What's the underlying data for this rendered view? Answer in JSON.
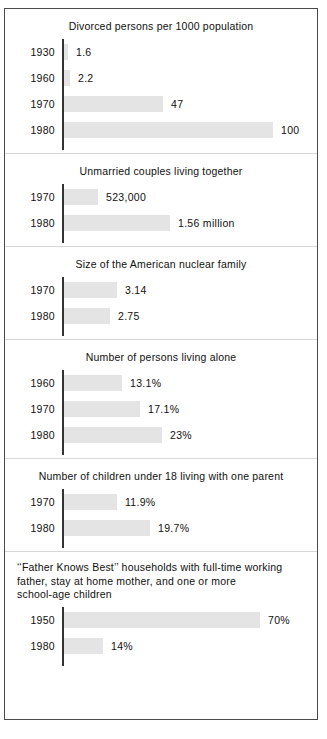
{
  "figure": {
    "border_color": "#4a4a4a",
    "bar_color": "#e4e4e4",
    "axis_color": "#333333",
    "divider_color": "#d8d8d8",
    "background": "#ffffff"
  },
  "chart_data": {
    "type": "bar",
    "title": "",
    "orientation": "horizontal",
    "grid": false,
    "legend": "none",
    "panels": [
      {
        "title": "Divorced persons per 1000 population",
        "title_lines": [
          "Divorced persons per 1000 population"
        ],
        "categories": [
          "1930",
          "1960",
          "1970",
          "1980"
        ],
        "values": [
          1.6,
          2.2,
          47,
          100
        ],
        "labels": [
          "1.6",
          "2.2",
          "47",
          "100"
        ],
        "bar_px": [
          4,
          6,
          99,
          209
        ],
        "xlabel": "",
        "ylabel": ""
      },
      {
        "title": "Unmarried couples living together",
        "title_lines": [
          "Unmarried couples living together"
        ],
        "categories": [
          "1970",
          "1980"
        ],
        "values": [
          523000,
          1560000
        ],
        "labels": [
          "523,000",
          "1.56 million"
        ],
        "bar_px": [
          34,
          106
        ],
        "xlabel": "",
        "ylabel": ""
      },
      {
        "title": "Size of the American nuclear family",
        "title_lines": [
          "Size of the American nuclear family"
        ],
        "categories": [
          "1970",
          "1980"
        ],
        "values": [
          3.14,
          2.75
        ],
        "labels": [
          "3.14",
          "2.75"
        ],
        "bar_px": [
          53,
          46
        ],
        "xlabel": "",
        "ylabel": ""
      },
      {
        "title": "Number of persons living alone",
        "title_lines": [
          "Number of persons living alone"
        ],
        "categories": [
          "1960",
          "1970",
          "1980"
        ],
        "values": [
          13.1,
          17.1,
          23
        ],
        "labels": [
          "13.1%",
          "17.1%",
          "23%"
        ],
        "bar_px": [
          58,
          76,
          98
        ],
        "xlabel": "",
        "ylabel": ""
      },
      {
        "title": "Number of children under 18 living with one parent",
        "title_lines": [
          "Number of children under 18 living with one parent"
        ],
        "categories": [
          "1970",
          "1980"
        ],
        "values": [
          11.9,
          19.7
        ],
        "labels": [
          "11.9%",
          "19.7%"
        ],
        "bar_px": [
          53,
          86
        ],
        "xlabel": "",
        "ylabel": ""
      },
      {
        "title": "‘‘Father Knows Best’’ households with full-time working father, stay at home mother, and one or more school-age children",
        "title_lines": [
          "‘‘Father Knows Best’’ households with full-time working",
          "father, stay at home mother, and one or more",
          "school-age children"
        ],
        "categories": [
          "1950",
          "1980"
        ],
        "values": [
          70,
          14
        ],
        "labels": [
          "70%",
          "14%"
        ],
        "bar_px": [
          196,
          39
        ],
        "xlabel": "",
        "ylabel": ""
      }
    ]
  }
}
